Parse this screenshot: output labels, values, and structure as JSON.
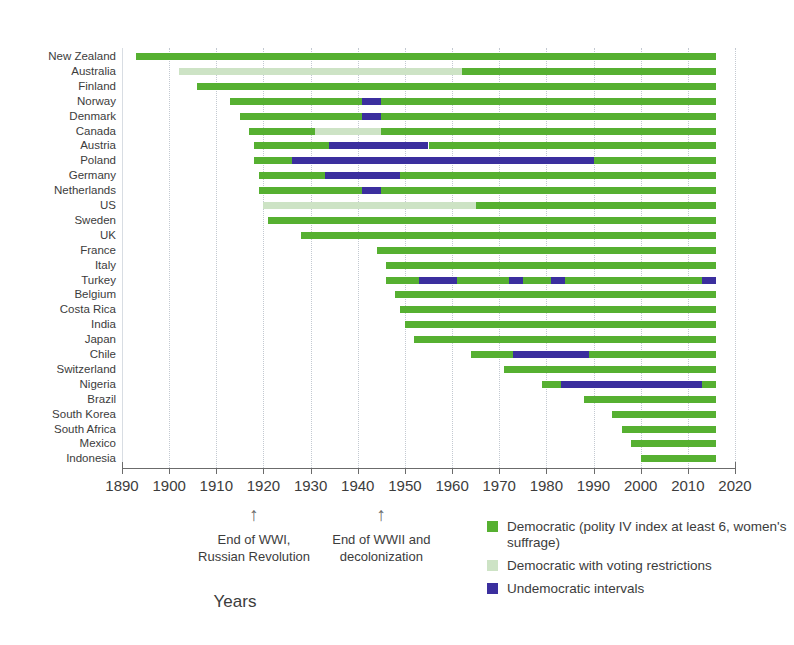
{
  "chart_data": {
    "type": "bar",
    "subtype": "gantt-timeline",
    "title": "",
    "xlabel": "Years",
    "ylabel": "",
    "xlim": [
      1890,
      2020
    ],
    "xticks": [
      1890,
      1900,
      1910,
      1920,
      1930,
      1940,
      1950,
      1960,
      1970,
      1980,
      1990,
      2000,
      2010,
      2020
    ],
    "grid": "vertical",
    "legend_position": "bottom-right",
    "colors": {
      "democratic": "#56b031",
      "restricted": "#cde3c5",
      "undemocratic": "#3b2f9e"
    },
    "legend": [
      {
        "key": "democratic",
        "swatch": "#56b031",
        "label": "Democratic (polity IV index at least 6, women's suffrage)"
      },
      {
        "key": "restricted",
        "swatch": "#cde3c5",
        "label": "Democratic with voting restrictions"
      },
      {
        "key": "undemocratic",
        "swatch": "#3b2f9e",
        "label": "Undemocratic intervals"
      }
    ],
    "annotations": [
      {
        "year": 1918,
        "arrow": "↑",
        "line1": "End of WWI,",
        "line2": "Russian Revolution"
      },
      {
        "year": 1945,
        "arrow": "↑",
        "line1": "End of WWII and",
        "line2": "decolonization"
      }
    ],
    "categories": [
      "New Zealand",
      "Australia",
      "Finland",
      "Norway",
      "Denmark",
      "Canada",
      "Austria",
      "Poland",
      "Germany",
      "Netherlands",
      "US",
      "Sweden",
      "UK",
      "France",
      "Italy",
      "Turkey",
      "Belgium",
      "Costa Rica",
      "India",
      "Japan",
      "Chile",
      "Switzerland",
      "Nigeria",
      "Brazil",
      "South Korea",
      "South Africa",
      "Mexico",
      "Indonesia"
    ],
    "rows": [
      {
        "country": "New Zealand",
        "segments": [
          {
            "type": "democratic",
            "start": 1893,
            "end": 2016
          }
        ]
      },
      {
        "country": "Australia",
        "segments": [
          {
            "type": "restricted",
            "start": 1902,
            "end": 1962
          },
          {
            "type": "democratic",
            "start": 1962,
            "end": 2016
          }
        ]
      },
      {
        "country": "Finland",
        "segments": [
          {
            "type": "democratic",
            "start": 1906,
            "end": 2016
          }
        ]
      },
      {
        "country": "Norway",
        "segments": [
          {
            "type": "democratic",
            "start": 1913,
            "end": 1941
          },
          {
            "type": "undemocratic",
            "start": 1941,
            "end": 1945
          },
          {
            "type": "democratic",
            "start": 1945,
            "end": 2016
          }
        ]
      },
      {
        "country": "Denmark",
        "segments": [
          {
            "type": "democratic",
            "start": 1915,
            "end": 1941
          },
          {
            "type": "undemocratic",
            "start": 1941,
            "end": 1945
          },
          {
            "type": "democratic",
            "start": 1945,
            "end": 2016
          }
        ]
      },
      {
        "country": "Canada",
        "segments": [
          {
            "type": "democratic",
            "start": 1917,
            "end": 1931
          },
          {
            "type": "restricted",
            "start": 1931,
            "end": 1945
          },
          {
            "type": "democratic",
            "start": 1945,
            "end": 2016
          }
        ]
      },
      {
        "country": "Austria",
        "segments": [
          {
            "type": "democratic",
            "start": 1918,
            "end": 1934
          },
          {
            "type": "undemocratic",
            "start": 1934,
            "end": 1955
          },
          {
            "type": "democratic",
            "start": 1955,
            "end": 2016
          }
        ]
      },
      {
        "country": "Poland",
        "segments": [
          {
            "type": "democratic",
            "start": 1918,
            "end": 1926
          },
          {
            "type": "undemocratic",
            "start": 1926,
            "end": 1990
          },
          {
            "type": "democratic",
            "start": 1990,
            "end": 2016
          }
        ]
      },
      {
        "country": "Germany",
        "segments": [
          {
            "type": "democratic",
            "start": 1919,
            "end": 1933
          },
          {
            "type": "undemocratic",
            "start": 1933,
            "end": 1949
          },
          {
            "type": "democratic",
            "start": 1949,
            "end": 2016
          }
        ]
      },
      {
        "country": "Netherlands",
        "segments": [
          {
            "type": "democratic",
            "start": 1919,
            "end": 1941
          },
          {
            "type": "undemocratic",
            "start": 1941,
            "end": 1945
          },
          {
            "type": "democratic",
            "start": 1945,
            "end": 2016
          }
        ]
      },
      {
        "country": "US",
        "segments": [
          {
            "type": "restricted",
            "start": 1920,
            "end": 1965
          },
          {
            "type": "democratic",
            "start": 1965,
            "end": 2016
          }
        ]
      },
      {
        "country": "Sweden",
        "segments": [
          {
            "type": "democratic",
            "start": 1921,
            "end": 2016
          }
        ]
      },
      {
        "country": "UK",
        "segments": [
          {
            "type": "democratic",
            "start": 1928,
            "end": 2016
          }
        ]
      },
      {
        "country": "France",
        "segments": [
          {
            "type": "democratic",
            "start": 1944,
            "end": 2016
          }
        ]
      },
      {
        "country": "Italy",
        "segments": [
          {
            "type": "democratic",
            "start": 1946,
            "end": 2016
          }
        ]
      },
      {
        "country": "Turkey",
        "segments": [
          {
            "type": "democratic",
            "start": 1946,
            "end": 1953
          },
          {
            "type": "undemocratic",
            "start": 1953,
            "end": 1961
          },
          {
            "type": "democratic",
            "start": 1961,
            "end": 1972
          },
          {
            "type": "undemocratic",
            "start": 1972,
            "end": 1975
          },
          {
            "type": "democratic",
            "start": 1975,
            "end": 1981
          },
          {
            "type": "undemocratic",
            "start": 1981,
            "end": 1984
          },
          {
            "type": "democratic",
            "start": 1984,
            "end": 2013
          },
          {
            "type": "undemocratic",
            "start": 2013,
            "end": 2016
          }
        ]
      },
      {
        "country": "Belgium",
        "segments": [
          {
            "type": "democratic",
            "start": 1948,
            "end": 2016
          }
        ]
      },
      {
        "country": "Costa Rica",
        "segments": [
          {
            "type": "democratic",
            "start": 1949,
            "end": 2016
          }
        ]
      },
      {
        "country": "India",
        "segments": [
          {
            "type": "democratic",
            "start": 1950,
            "end": 2016
          }
        ]
      },
      {
        "country": "Japan",
        "segments": [
          {
            "type": "democratic",
            "start": 1952,
            "end": 2016
          }
        ]
      },
      {
        "country": "Chile",
        "segments": [
          {
            "type": "democratic",
            "start": 1964,
            "end": 1973
          },
          {
            "type": "undemocratic",
            "start": 1973,
            "end": 1989
          },
          {
            "type": "democratic",
            "start": 1989,
            "end": 2016
          }
        ]
      },
      {
        "country": "Switzerland",
        "segments": [
          {
            "type": "democratic",
            "start": 1971,
            "end": 2016
          }
        ]
      },
      {
        "country": "Nigeria",
        "segments": [
          {
            "type": "democratic",
            "start": 1979,
            "end": 1983
          },
          {
            "type": "undemocratic",
            "start": 1983,
            "end": 2013
          },
          {
            "type": "democratic",
            "start": 2013,
            "end": 2016
          }
        ]
      },
      {
        "country": "Brazil",
        "segments": [
          {
            "type": "democratic",
            "start": 1988,
            "end": 2016
          }
        ]
      },
      {
        "country": "South Korea",
        "segments": [
          {
            "type": "democratic",
            "start": 1994,
            "end": 2016
          }
        ]
      },
      {
        "country": "South Africa",
        "segments": [
          {
            "type": "democratic",
            "start": 1996,
            "end": 2016
          }
        ]
      },
      {
        "country": "Mexico",
        "segments": [
          {
            "type": "democratic",
            "start": 1998,
            "end": 2016
          }
        ]
      },
      {
        "country": "Indonesia",
        "segments": [
          {
            "type": "democratic",
            "start": 2000,
            "end": 2016
          }
        ]
      }
    ]
  }
}
